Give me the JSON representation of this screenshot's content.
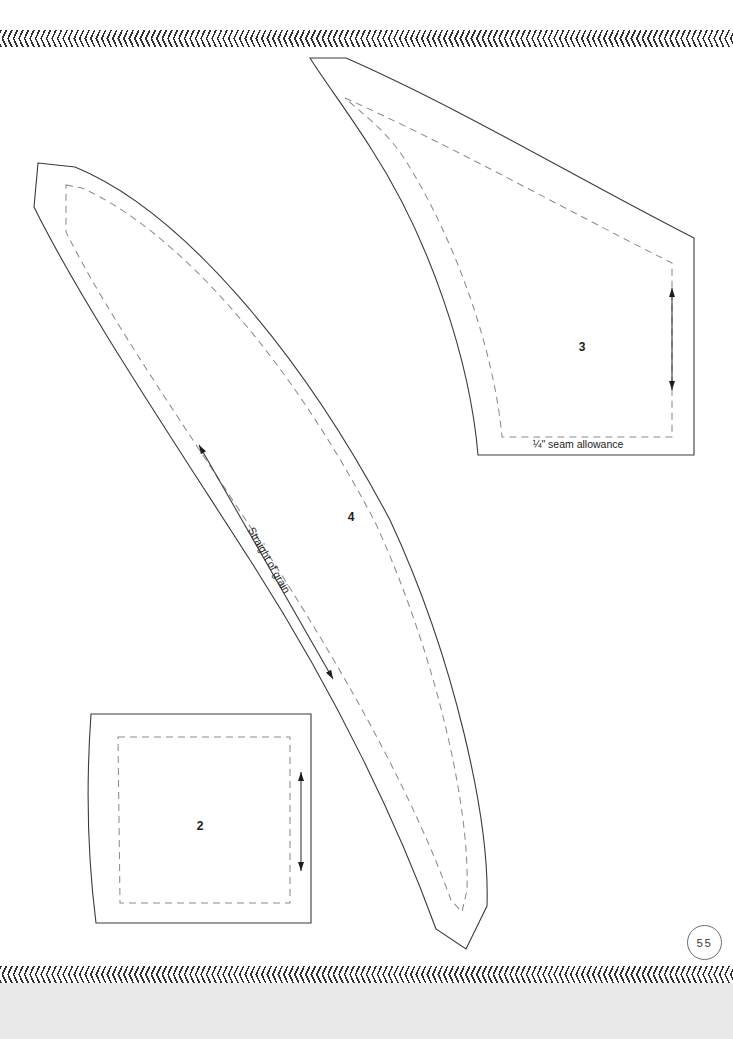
{
  "page": {
    "number": "55",
    "background_color": "#ffffff",
    "footer_strip_color": "#e9e9e9"
  },
  "footer": {
    "title": "PLAID GARDEN"
  },
  "decor": {
    "top_band_name": "chevron-band",
    "bottom_band_name": "chevron-band",
    "dotted_rule_name": "dotted-rule"
  },
  "pattern": {
    "pieces": [
      {
        "id": "piece-4",
        "label": "4",
        "label_x": 351,
        "label_y": 521,
        "cut_path": "M 38 163 L 75 167 C 180 210 300 350 390 520 C 455 660 490 820 487 906 L 466 949 L 436 929 C 400 830 340 700 250 560 C 160 420 80 300 34 207 Z",
        "stitch_path": "M 66 185 L 82 188 C 180 232 292 362 376 524 C 436 656 470 806 467 890 L 462 912 L 451 900 C 417 806 356 690 272 560 C 186 428 110 320 66 232 Z",
        "grain": {
          "x1": 333,
          "y1": 679,
          "x2": 199,
          "y2": 445,
          "text": "Straight of grain",
          "text_x": 266,
          "text_y": 562,
          "text_rotation": 60.3
        }
      },
      {
        "id": "piece-3",
        "label": "3",
        "label_x": 582,
        "label_y": 351,
        "cut_path": "M 310 58 L 346 58 C 460 108 580 180 694 238 L 694 455 L 478 455 C 470 360 430 240 372 150 C 348 112 325 82 310 58 Z",
        "stitch_path": "M 345 98 C 450 145 570 212 672 263 L 672 437 L 502 437 C 494 350 456 240 404 158 C 384 128 360 112 345 98 Z",
        "grain": {
          "x1": 672,
          "y1": 390,
          "x2": 672,
          "y2": 288,
          "text": null
        },
        "note": {
          "text": "¼\" seam allowance",
          "x": 578,
          "y": 448
        }
      },
      {
        "id": "piece-2",
        "label": "2",
        "label_x": 200,
        "label_y": 830,
        "cut_path": "M 91 714 L 311 714 L 311 923 L 96 923 C 88 860 86 785 91 714 Z",
        "stitch_path": "M 118 737 L 290 737 L 290 903 L 120 903 Z",
        "grain": {
          "x1": 301,
          "y1": 871,
          "x2": 301,
          "y2": 772,
          "text": null
        }
      }
    ],
    "legend": {
      "cut_line_label": "cutting line",
      "stitch_line_label": "stitching line",
      "grain_label": "Straight of grain",
      "seam_allowance_label": "¼\" seam allowance"
    }
  },
  "colors": {
    "cut_line": "#3b3b3b",
    "stitch_line": "#8c8c8c",
    "ink": "#1d1d1d",
    "footer_text": "#3a3a3a"
  }
}
